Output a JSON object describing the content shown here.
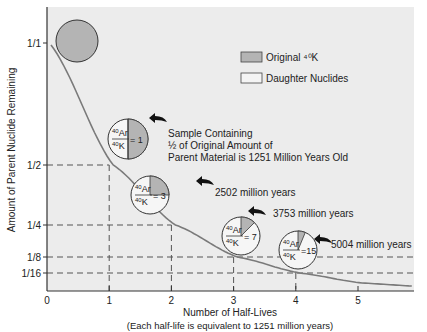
{
  "chart_data": {
    "type": "line",
    "title": "",
    "xlabel": "Number of Half-Lives",
    "xlabel_sub": "(Each half-life is equivalent to 1251 million years)",
    "ylabel": "Amount of Parent Nuclide Remaining",
    "x_ticks": [
      "0",
      "1",
      "2",
      "3",
      "4",
      "5"
    ],
    "y_ticks": [
      {
        "label": "1/1",
        "value": 1
      },
      {
        "label": "1/2",
        "value": 0.5
      },
      {
        "label": "1/4",
        "value": 0.25
      },
      {
        "label": "1/8",
        "value": 0.125
      },
      {
        "label": "1/16",
        "value": 0.0625
      }
    ],
    "series": [
      {
        "name": "Parent 40K remaining",
        "x": [
          0,
          1,
          2,
          3,
          4,
          5,
          5.8
        ],
        "y": [
          1,
          0.5,
          0.25,
          0.125,
          0.0625,
          0.03125,
          0.018
        ]
      }
    ],
    "xlim": [
      0,
      5.8
    ],
    "legend": [
      {
        "label": "Original ⁴⁰K",
        "color": "#b4b4b4"
      },
      {
        "label": "Daughter Nuclides",
        "color": "#f4f4f4"
      }
    ],
    "annotations": [
      {
        "half_lives": 1,
        "ratio_text": "= 1",
        "parent_fraction": 0.5,
        "age_text": "Sample Containing",
        "age_text_2": "½ of Original Amount of",
        "age_text_3": "Parent Material is 1251 Million Years Old"
      },
      {
        "half_lives": 2,
        "ratio_text": "= 3",
        "parent_fraction": 0.25,
        "age_text": "2502 million years"
      },
      {
        "half_lives": 3,
        "ratio_text": "= 7",
        "parent_fraction": 0.125,
        "age_text": "3753 million years"
      },
      {
        "half_lives": 4,
        "ratio_text": "=15",
        "parent_fraction": 0.0625,
        "age_text": "5004 million years"
      }
    ]
  },
  "labels": {
    "ratio_num": "40",
    "ratio_num_el": "Ar",
    "ratio_den": "40",
    "ratio_den_el": "K"
  },
  "colors": {
    "panel": "#ececec",
    "parent": "#b4b4b4",
    "daughter": "#f6f6f6",
    "curve": "#7a7a7a",
    "dash": "#555555"
  }
}
